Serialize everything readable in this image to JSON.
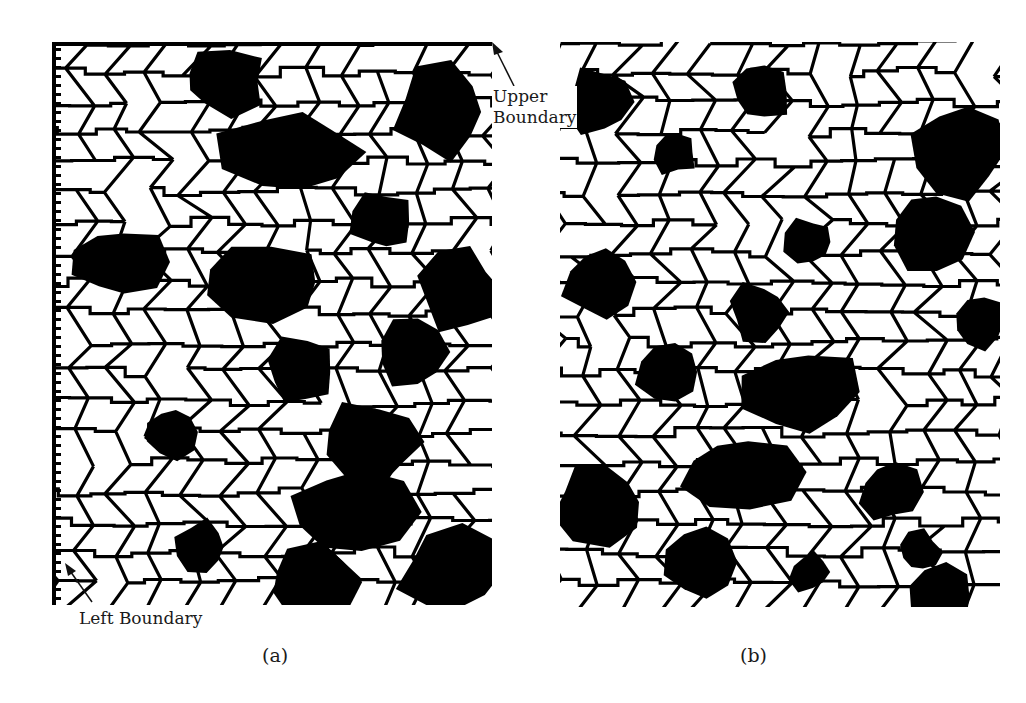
{
  "figure": {
    "panels": [
      {
        "id": "a",
        "caption": "(a)",
        "description": "Grain microstructure map with boundary annotations"
      },
      {
        "id": "b",
        "caption": "(b)",
        "description": "Grain microstructure map"
      }
    ],
    "annotations": {
      "upper": {
        "line1": "Upper",
        "line2": "Boundary"
      },
      "left": "Left Boundary"
    },
    "colors": {
      "grain_fill": "#ffffff",
      "boundary": "#000000",
      "dark_phase": "#000000",
      "background": "#ffffff"
    }
  }
}
